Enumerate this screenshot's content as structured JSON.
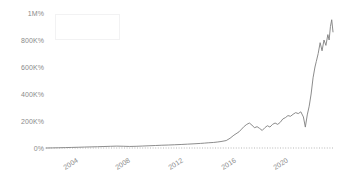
{
  "chart_data": {
    "type": "line",
    "title": "",
    "subtitle": "",
    "xlabel": "",
    "ylabel": "",
    "grid": false,
    "legend_position": "top-left",
    "legend_entries": [],
    "xlim": [
      2002.0,
      2024.3
    ],
    "ylim": [
      -40000,
      1000000
    ],
    "y_ticks": [
      {
        "value": 1000000,
        "label": "1M%"
      },
      {
        "value": 800000,
        "label": "800K%"
      },
      {
        "value": 600000,
        "label": "600K%"
      },
      {
        "value": 400000,
        "label": "400K%"
      },
      {
        "value": 200000,
        "label": "200K%"
      },
      {
        "value": 0,
        "label": "0%"
      }
    ],
    "x_ticks": [
      {
        "value": 2004,
        "label": "2004"
      },
      {
        "value": 2008,
        "label": "2008"
      },
      {
        "value": 2012,
        "label": "2012"
      },
      {
        "value": 2016,
        "label": "2016"
      },
      {
        "value": 2020,
        "label": "2020"
      }
    ],
    "zero_reference_line": {
      "value": 0,
      "style": "dotted",
      "color": "#9a9a9a"
    },
    "series": [
      {
        "name": "",
        "color": "#7f7f7f",
        "x": [
          2002.0,
          2002.5,
          2003.0,
          2003.5,
          2004.0,
          2004.5,
          2005.0,
          2005.5,
          2006.0,
          2006.5,
          2007.0,
          2007.5,
          2008.0,
          2008.5,
          2009.0,
          2009.5,
          2010.0,
          2010.5,
          2011.0,
          2011.5,
          2012.0,
          2012.5,
          2013.0,
          2013.5,
          2014.0,
          2014.3,
          2014.6,
          2015.0,
          2015.3,
          2015.6,
          2016.0,
          2016.3,
          2016.6,
          2017.0,
          2017.2,
          2017.4,
          2017.6,
          2017.8,
          2018.0,
          2018.2,
          2018.4,
          2018.6,
          2018.8,
          2019.0,
          2019.2,
          2019.4,
          2019.6,
          2019.8,
          2020.0,
          2020.2,
          2020.4,
          2020.6,
          2020.8,
          2021.0,
          2021.2,
          2021.4,
          2021.6,
          2021.8,
          2022.0,
          2022.15,
          2022.3,
          2022.45,
          2022.6,
          2022.75,
          2022.9,
          2023.0,
          2023.15,
          2023.3,
          2023.45,
          2023.6,
          2023.75,
          2023.9,
          2024.0,
          2024.1,
          2024.2,
          2024.3
        ],
        "y": [
          0,
          900,
          1800,
          3000,
          4200,
          5500,
          7000,
          8200,
          9500,
          11000,
          12500,
          14000,
          13000,
          11500,
          12500,
          14500,
          16500,
          18500,
          20500,
          22000,
          24000,
          26000,
          28500,
          31000,
          34000,
          36000,
          38500,
          41000,
          44000,
          48000,
          55000,
          72000,
          95000,
          120000,
          140000,
          160000,
          175000,
          185000,
          170000,
          150000,
          158000,
          145000,
          130000,
          150000,
          165000,
          155000,
          175000,
          185000,
          175000,
          190000,
          215000,
          225000,
          240000,
          235000,
          250000,
          262000,
          255000,
          268000,
          230000,
          155000,
          245000,
          310000,
          400000,
          520000,
          600000,
          640000,
          700000,
          780000,
          720000,
          800000,
          760000,
          840000,
          800000,
          900000,
          950000,
          860000
        ]
      }
    ]
  },
  "axes": {
    "y_tick_labels": [
      "1M%",
      "800K%",
      "600K%",
      "400K%",
      "200K%",
      "0%"
    ],
    "x_tick_labels": [
      "2004",
      "2008",
      "2012",
      "2016",
      "2020"
    ]
  },
  "colors": {
    "line": "#7f7f7f",
    "tick_text": "#8a8a8a",
    "baseline": "#9a9a9a",
    "legend_border": "#f2f2f3",
    "background": "#ffffff"
  }
}
